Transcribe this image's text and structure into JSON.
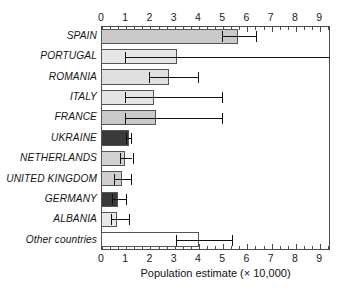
{
  "chart_data": {
    "type": "bar",
    "orientation": "horizontal",
    "title": "",
    "xlabel": "Population estimate (× 10,000)",
    "ylabel": "",
    "xlim": [
      0,
      9.45
    ],
    "xticks": [
      0,
      1,
      2,
      3,
      4,
      5,
      6,
      7,
      8,
      9
    ],
    "xtick_labels": [
      "0",
      "1",
      "2",
      "3",
      "4",
      "5",
      "6",
      "7",
      "8",
      "9"
    ],
    "minor_ticks_per_interval": 2,
    "axis_positions": [
      "top",
      "bottom"
    ],
    "grid": false,
    "legend": null,
    "categories": [
      "SPAIN",
      "PORTUGAL",
      "ROMANIA",
      "ITALY",
      "FRANCE",
      "UKRAINE",
      "NETHERLANDS",
      "UNITED KINGDOM",
      "GERMANY",
      "ALBANIA",
      "Other countries"
    ],
    "values": [
      5.65,
      3.15,
      2.8,
      2.2,
      2.25,
      1.15,
      1.0,
      0.85,
      0.72,
      0.68,
      4.05
    ],
    "error_low": [
      5.0,
      1.0,
      2.0,
      1.0,
      1.0,
      1.05,
      0.8,
      0.55,
      0.45,
      0.4,
      3.1
    ],
    "error_high": [
      6.4,
      9.45,
      4.0,
      5.0,
      5.0,
      1.25,
      1.3,
      1.25,
      1.05,
      1.15,
      5.4
    ],
    "error_high_clipped": [
      false,
      true,
      false,
      false,
      false,
      false,
      false,
      false,
      false,
      false,
      false
    ],
    "bar_fills": [
      "#c9c9c9",
      "#e6e6e6",
      "#e0e0e0",
      "#e4e4e4",
      "#c9c9c9",
      "#3a3a3a",
      "#d2d2d2",
      "#cfcfcf",
      "#3a3a3a",
      "#e8e8e8",
      "#ffffff"
    ],
    "bar_edge_color": "#555555",
    "error_color": "#111111",
    "axis_color": "#4a4a4a"
  }
}
